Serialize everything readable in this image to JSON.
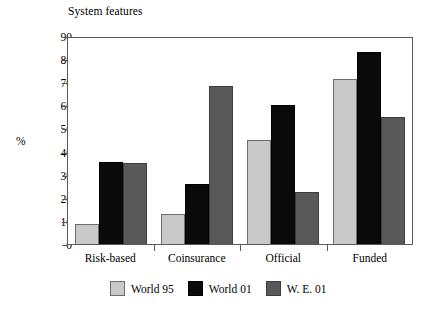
{
  "chart_data": {
    "type": "bar",
    "title": "System features",
    "xlabel": "",
    "ylabel": "%",
    "ylim": [
      0,
      90
    ],
    "ytick_step": 10,
    "yticks": [
      90,
      80,
      70,
      60,
      50,
      40,
      30,
      20,
      10,
      0
    ],
    "grid": false,
    "legend_position": "bottom",
    "categories": [
      "Risk-based",
      "Coinsurance",
      "Official",
      "Funded"
    ],
    "series": [
      {
        "name": "World 95",
        "color": "#c9c9c9",
        "values": [
          8.5,
          13,
          45,
          71.5
        ]
      },
      {
        "name": "World 01",
        "color": "#0a0a0a",
        "values": [
          35.5,
          26,
          60,
          83
        ]
      },
      {
        "name": "W. E. 01",
        "color": "#595959",
        "values": [
          35,
          68.5,
          22.5,
          55
        ]
      }
    ]
  },
  "legend": {
    "entries": [
      {
        "label": "World 95"
      },
      {
        "label": "World 01"
      },
      {
        "label": "W. E. 01"
      }
    ]
  }
}
